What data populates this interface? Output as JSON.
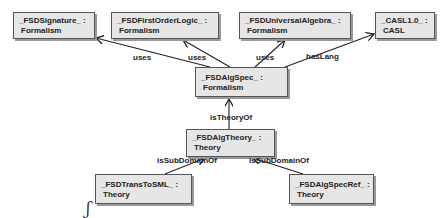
{
  "diagram": {
    "nodes": [
      {
        "id": "sig",
        "name": "_FSDSignature_ :",
        "type": "Formalism",
        "box": [
          13,
          12,
          82,
          27
        ]
      },
      {
        "id": "fol",
        "name": "_FSDFirstOrderLogic_ :",
        "type": "Formalism",
        "box": [
          111,
          12,
          108,
          27
        ]
      },
      {
        "id": "ua",
        "name": "_FSDUniversalAlgebra_ :",
        "type": "Formalism",
        "box": [
          239,
          12,
          112,
          27
        ]
      },
      {
        "id": "casl",
        "name": "_CASL1.0_ :",
        "type": "CASL",
        "box": [
          375,
          12,
          60,
          27
        ]
      },
      {
        "id": "algspec",
        "name": "_FSDAlgSpec_ :",
        "type": "Formalism",
        "box": [
          195,
          67,
          93,
          30
        ]
      },
      {
        "id": "algtheory",
        "name": "_FSDAlgTheory_ :",
        "type": "Theory",
        "box": [
          186,
          129,
          89,
          28
        ]
      },
      {
        "id": "trans",
        "name": "_FSDTransToSML_ :",
        "type": "Theory",
        "box": [
          95,
          174,
          97,
          30
        ]
      },
      {
        "id": "specref",
        "name": "_FSDAlgSpecRef_ :",
        "type": "Theory",
        "box": [
          289,
          174,
          85,
          30
        ]
      }
    ],
    "edges": [
      {
        "from": "algspec",
        "to": "sig",
        "label": "uses"
      },
      {
        "from": "algspec",
        "to": "fol",
        "label": "uses"
      },
      {
        "from": "algspec",
        "to": "ua",
        "label": "uses"
      },
      {
        "from": "algspec",
        "to": "casl",
        "label": "hasLang"
      },
      {
        "from": "algtheory",
        "to": "algspec",
        "label": "isTheoryOf"
      },
      {
        "from": "trans",
        "to": "algtheory",
        "label": "isSubDomainOf"
      },
      {
        "from": "specref",
        "to": "algtheory",
        "label": "isSubDomainOf"
      }
    ],
    "mark": "ʃ"
  }
}
